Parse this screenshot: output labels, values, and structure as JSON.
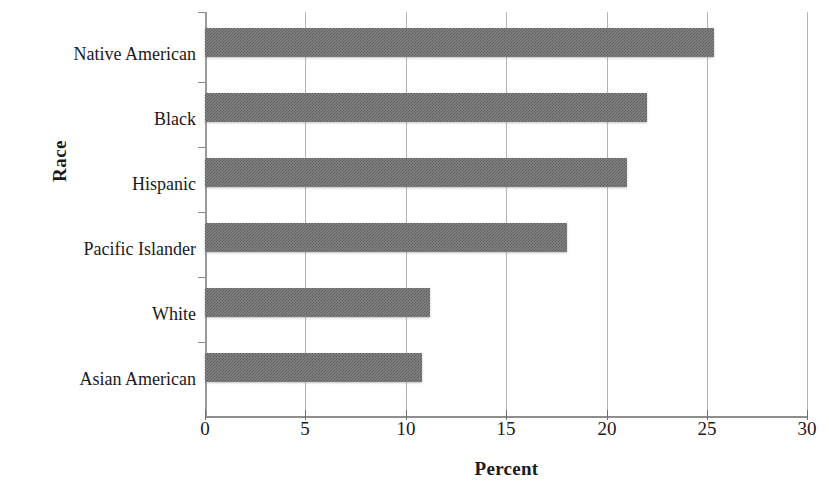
{
  "chart_data": {
    "type": "bar",
    "orientation": "horizontal",
    "title": "",
    "xlabel": "Percent",
    "ylabel": "Race",
    "categories": [
      "Native American",
      "Black",
      "Hispanic",
      "Pacific Islander",
      "White",
      "Asian American"
    ],
    "values": [
      25.3,
      22.0,
      21.0,
      18.0,
      11.2,
      10.8
    ],
    "xlim": [
      0,
      30
    ],
    "xticks": [
      0,
      5,
      10,
      15,
      20,
      25,
      30
    ],
    "xtick_labels": [
      "0",
      "5",
      "10",
      "15",
      "20",
      "25",
      "30"
    ],
    "grid": "vertical",
    "legend": "none",
    "bar_color": "#868686",
    "gridline_color": "#b4b4b4",
    "axis_color": "#8e8e8e",
    "text_color": "#1a1a1a"
  }
}
